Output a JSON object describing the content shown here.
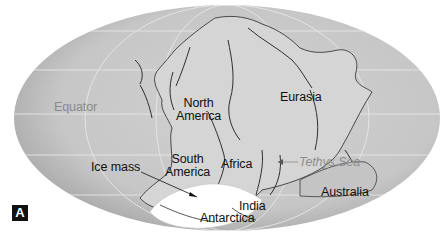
{
  "figure": {
    "panel_label": "A",
    "projection": "elliptical (Mollweide-style) world map",
    "colors": {
      "ocean": "#c9c9c9",
      "ocean_edge": "#a9a9a9",
      "land": "#d4d4d4",
      "ice": "#ffffff",
      "graticule": "#ececec",
      "label_text": "#111111",
      "gray_label_text": "#8a8a8a"
    }
  },
  "labels": {
    "equator": "Equator",
    "north_america_line1": "North",
    "north_america_line2": "America",
    "eurasia": "Eurasia",
    "south_america_line1": "South",
    "south_america_line2": "America",
    "africa": "Africa",
    "tethys_sea": "Tethys Sea",
    "ice_mass": "Ice mass",
    "india": "India",
    "antarctica": "Antarctica",
    "australia": "Australia"
  }
}
